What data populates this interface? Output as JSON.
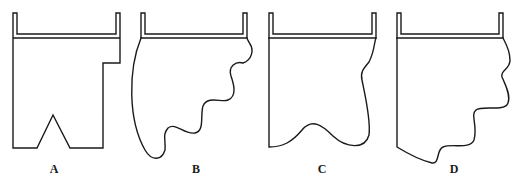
{
  "figure": {
    "panels": [
      {
        "id": "A",
        "label": "A",
        "shape": "rectangular-with-step-and-v-notch"
      },
      {
        "id": "B",
        "label": "B",
        "shape": "wavy-curved-boundary"
      },
      {
        "id": "C",
        "label": "C",
        "shape": "gently-curved-boundary"
      },
      {
        "id": "D",
        "label": "D",
        "shape": "wavy-stepped-boundary"
      }
    ]
  }
}
